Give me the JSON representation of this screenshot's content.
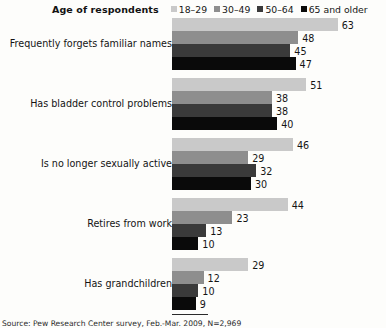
{
  "legend": {
    "title": "Age of respondents",
    "items": [
      {
        "label": "18–29",
        "color": "#c9c9c9"
      },
      {
        "label": "30–49",
        "color": "#8e8e8e"
      },
      {
        "label": "50–64",
        "color": "#3a3a3a"
      },
      {
        "label": "65 and older",
        "color": "#0a0a0a"
      }
    ]
  },
  "footer": {
    "source": "Source: Pew Research Center survey, Feb.-Mar. 2009, N=2,969"
  },
  "chart_data": {
    "type": "bar",
    "orientation": "horizontal",
    "title": "",
    "xlabel": "",
    "ylabel": "",
    "xlim": [
      0,
      63
    ],
    "grid": false,
    "legend_position": "top-right",
    "px_per_unit": 2.63,
    "categories": [
      "Frequently forgets familiar names",
      "Has bladder control problems",
      "Is no longer sexually active",
      "Retires from work",
      "Has grandchildren"
    ],
    "series": [
      {
        "name": "18–29",
        "color": "#c9c9c9",
        "values": [
          63,
          51,
          46,
          44,
          29
        ]
      },
      {
        "name": "30–49",
        "color": "#8e8e8e",
        "values": [
          48,
          38,
          29,
          23,
          12
        ]
      },
      {
        "name": "50–64",
        "color": "#3a3a3a",
        "values": [
          45,
          38,
          32,
          13,
          10
        ]
      },
      {
        "name": "65 and older",
        "color": "#0a0a0a",
        "values": [
          47,
          40,
          30,
          10,
          9
        ]
      }
    ]
  }
}
